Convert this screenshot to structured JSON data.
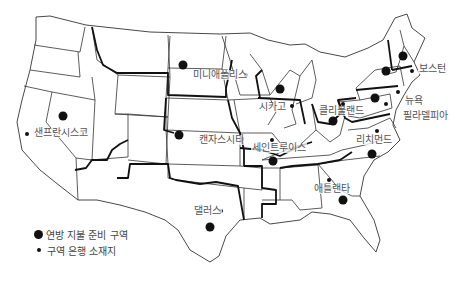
{
  "map": {
    "subject": "Federal Reserve Districts of the United States",
    "colors": {
      "boundary": "#111111",
      "state_line": "#333333",
      "label": "#555555",
      "background": "#ffffff"
    }
  },
  "cities": [
    {
      "name": "보스턴",
      "x": 412,
      "y": 71
    },
    {
      "name": "뉴욕",
      "x": 398,
      "y": 92
    },
    {
      "name": "필라델피아",
      "x": 386,
      "y": 104
    },
    {
      "name": "클리블랜드",
      "x": 343,
      "y": 104
    },
    {
      "name": "리치먼드",
      "x": 377,
      "y": 131
    },
    {
      "name": "애틀랜타",
      "x": 329,
      "y": 180
    },
    {
      "name": "시카고",
      "x": 292,
      "y": 106
    },
    {
      "name": "세인트루이스",
      "x": 272,
      "y": 140
    },
    {
      "name": "미니애폴리스",
      "x": 246,
      "y": 75
    },
    {
      "name": "캔자스시티",
      "x": 242,
      "y": 139
    },
    {
      "name": "댈러스",
      "x": 221,
      "y": 211
    },
    {
      "name": "샌프란시스코",
      "x": 27,
      "y": 134
    }
  ],
  "districts": [
    {
      "number": 1,
      "x": 403,
      "y": 56
    },
    {
      "number": 2,
      "x": 386,
      "y": 71
    },
    {
      "number": 3,
      "x": 375,
      "y": 98
    },
    {
      "number": 4,
      "x": 333,
      "y": 121
    },
    {
      "number": 5,
      "x": 372,
      "y": 154
    },
    {
      "number": 6,
      "x": 343,
      "y": 200
    },
    {
      "number": 7,
      "x": 280,
      "y": 89
    },
    {
      "number": 8,
      "x": 273,
      "y": 161
    },
    {
      "number": 9,
      "x": 183,
      "y": 65
    },
    {
      "number": 10,
      "x": 179,
      "y": 135
    },
    {
      "number": 11,
      "x": 210,
      "y": 227
    },
    {
      "number": 12,
      "x": 63,
      "y": 116
    }
  ],
  "legend": {
    "items": [
      {
        "symbol": "large-dot",
        "label": "연방 지불 준비 구역"
      },
      {
        "symbol": "small-dot",
        "label": "구역 은행 소재지"
      }
    ]
  }
}
